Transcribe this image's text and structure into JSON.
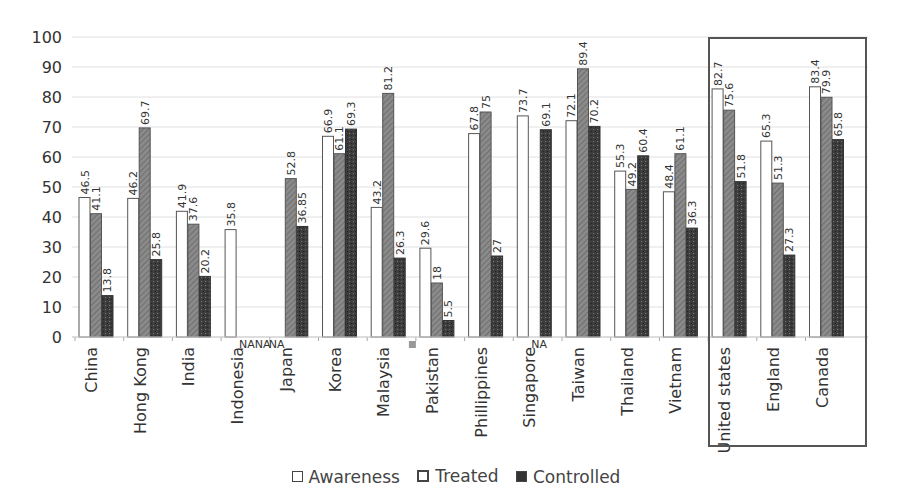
{
  "chart_data": {
    "type": "bar",
    "title": "",
    "xlabel": "",
    "ylabel": "",
    "ylim": [
      0,
      100
    ],
    "yticks": [
      0,
      10,
      20,
      30,
      40,
      50,
      60,
      70,
      80,
      90,
      100
    ],
    "grid": true,
    "legend_position": "bottom",
    "categories": [
      "China",
      "Hong Kong",
      "India",
      "Indonesia",
      "Japan",
      "Korea",
      "Malaysia",
      "Pakistan",
      "Phillippines",
      "Singapore",
      "Taiwan",
      "Thailand",
      "Vietnam",
      "United states",
      "England",
      "Canada"
    ],
    "series": [
      {
        "name": "Awareness",
        "color": "#ffffff",
        "values": [
          46.5,
          46.2,
          41.9,
          35.8,
          null,
          66.9,
          43.2,
          29.6,
          67.8,
          73.7,
          72.1,
          55.3,
          48.4,
          82.7,
          65.3,
          83.4
        ]
      },
      {
        "name": "Treated",
        "color": "#7a7a7a",
        "values": [
          41.1,
          69.7,
          37.6,
          null,
          52.8,
          61.1,
          81.2,
          18,
          75,
          null,
          89.4,
          49.2,
          61.1,
          75.6,
          51.3,
          79.9
        ]
      },
      {
        "name": "Controlled",
        "color": "#3a3a3a",
        "values": [
          13.8,
          25.8,
          20.2,
          null,
          36.85,
          69.3,
          26.3,
          5.5,
          27,
          69.1,
          70.2,
          60.4,
          36.3,
          51.8,
          27.3,
          65.8
        ]
      }
    ],
    "value_labels": {
      "Awareness": [
        "46.5",
        "46.2",
        "41.9",
        "35.8",
        "NA",
        "66.9",
        "43.2",
        "29.6",
        "67.8",
        "73.7",
        "72.1",
        "55.3",
        "48.4",
        "82.7",
        "65.3",
        "83.4"
      ],
      "Treated": [
        "41.1",
        "69.7",
        "37.6",
        "NA",
        "52.8",
        "61.1",
        "81.2",
        "18",
        "75",
        "NA",
        "89.4",
        "49.2",
        "61.1",
        "75.6",
        "51.3",
        "79.9"
      ],
      "Controlled": [
        "13.8",
        "25.8",
        "20.2",
        "NA",
        "36.85",
        "69.3",
        "26.3",
        "5.5",
        "27",
        "69.1",
        "70.2",
        "60.4",
        "36.3",
        "51.8",
        "27.3",
        "65.8"
      ]
    },
    "annotations": [
      {
        "type": "na-label",
        "text": "NANA",
        "category": "Indonesia"
      },
      {
        "type": "na-label",
        "text": "NA",
        "category": "Japan"
      },
      {
        "type": "na-label",
        "text": "NA",
        "category": "Singapore"
      },
      {
        "type": "highlight-box",
        "categories": [
          "United states",
          "England",
          "Canada"
        ]
      }
    ]
  },
  "legend": {
    "items": [
      {
        "label": "Awareness"
      },
      {
        "label": "Treated"
      },
      {
        "label": "Controlled"
      }
    ]
  }
}
